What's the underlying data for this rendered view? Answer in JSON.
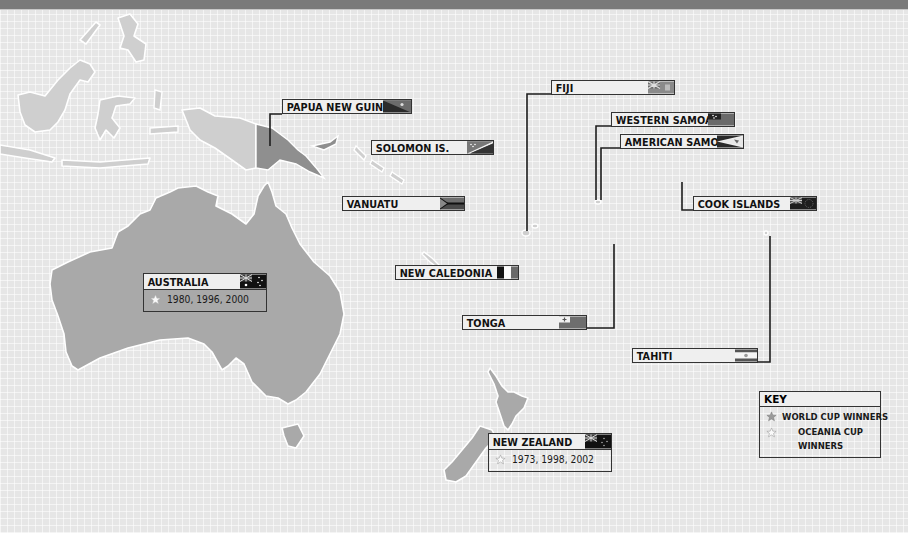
{
  "map": {
    "title": "Oceania football nations",
    "colors": {
      "background": "#e6e6e6",
      "land": "#a9a9a9",
      "land_highlight": "#8f8f8f",
      "land_other": "#cfcfcf",
      "top_bar": "#7a7a7a",
      "label_border": "#333333"
    }
  },
  "countries": {
    "papua_new_guinea": {
      "name": "PAPUA NEW GUINEA",
      "flag_icon": "papua-new-guinea-flag"
    },
    "solomon_islands": {
      "name": "SOLOMON IS.",
      "flag_icon": "solomon-islands-flag"
    },
    "vanuatu": {
      "name": "VANUATU",
      "flag_icon": "vanuatu-flag"
    },
    "fiji": {
      "name": "FIJI",
      "flag_icon": "fiji-flag"
    },
    "western_samoa": {
      "name": "WESTERN SAMOA",
      "flag_icon": "samoa-flag"
    },
    "american_samoa": {
      "name": "AMERICAN SAMOA",
      "flag_icon": "american-samoa-flag"
    },
    "cook_islands": {
      "name": "COOK ISLANDS",
      "flag_icon": "cook-islands-flag"
    },
    "new_caledonia": {
      "name": "NEW CALEDONIA",
      "flag_icon": "new-caledonia-flag"
    },
    "tonga": {
      "name": "TONGA",
      "flag_icon": "tonga-flag"
    },
    "tahiti": {
      "name": "TAHITI",
      "flag_icon": "tahiti-flag"
    },
    "australia": {
      "name": "AUSTRALIA",
      "flag_icon": "australia-flag",
      "oceania_cup_wins": "1980, 1996, 2000"
    },
    "new_zealand": {
      "name": "NEW ZEALAND",
      "flag_icon": "new-zealand-flag",
      "oceania_cup_wins": "1973, 1998, 2002"
    }
  },
  "key": {
    "title": "KEY",
    "items": [
      {
        "icon": "grey-star-icon",
        "label": "WORLD CUP WINNERS"
      },
      {
        "icon": "white-star-icon",
        "label_line1": "OCEANIA CUP",
        "label_line2": "WINNERS"
      }
    ]
  }
}
